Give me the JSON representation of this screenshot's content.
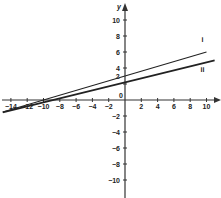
{
  "chart_data": {
    "type": "line",
    "title": "",
    "xlabel": "",
    "ylabel": "y",
    "xlim": [
      -15,
      11
    ],
    "ylim": [
      -11,
      11
    ],
    "grid": false,
    "x_ticks": [
      -14,
      -12,
      -10,
      -8,
      -6,
      -4,
      -2,
      0,
      2,
      4,
      6,
      8,
      10
    ],
    "y_ticks": [
      -10,
      -8,
      -6,
      -4,
      -2,
      2,
      4,
      6,
      8,
      10
    ],
    "annotations": [
      {
        "text": "i",
        "x": 9.5,
        "y": 7.3
      },
      {
        "text": "ii",
        "x": 9.5,
        "y": 3.5
      },
      {
        "text": "2",
        "x": -0.9,
        "y": 2.6
      }
    ],
    "series": [
      {
        "name": "i",
        "x": [
          -15,
          10
        ],
        "y": [
          -1.5,
          6.0
        ],
        "equation": "y = 0.3x + 3"
      },
      {
        "name": "ii",
        "x": [
          -15,
          11
        ],
        "y": [
          -1.55,
          4.95
        ],
        "equation": "y = 0.25x + 2.2"
      }
    ]
  }
}
